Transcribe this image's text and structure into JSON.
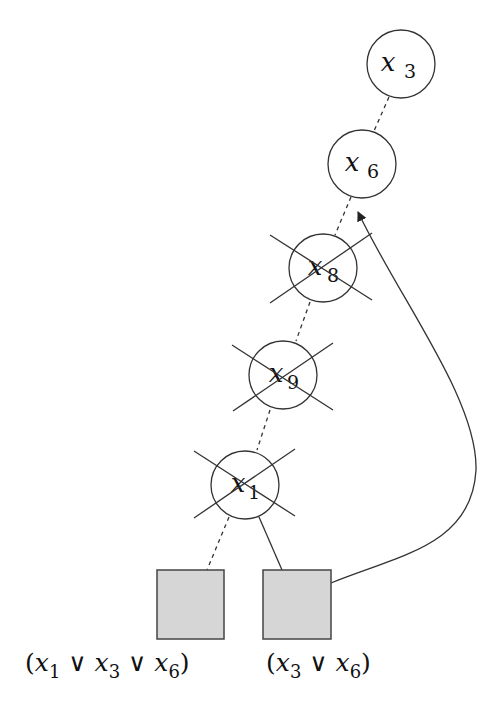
{
  "diagram": {
    "type": "implication-graph-backjump",
    "nodes": [
      {
        "id": "x3",
        "var": "x",
        "sub": "3",
        "crossed": false,
        "cx": 401,
        "cy": 64
      },
      {
        "id": "x6",
        "var": "x",
        "sub": "6",
        "crossed": false,
        "cx": 362,
        "cy": 164
      },
      {
        "id": "x8",
        "var": "x",
        "sub": "8",
        "crossed": true,
        "cx": 323,
        "cy": 268
      },
      {
        "id": "x9",
        "var": "x",
        "sub": "9",
        "crossed": true,
        "cx": 283,
        "cy": 375
      },
      {
        "id": "x1",
        "var": "x",
        "sub": "1",
        "crossed": true,
        "cx": 245,
        "cy": 485
      }
    ],
    "clauses": [
      {
        "id": "c1",
        "label_parts": [
          "(",
          "x",
          "1",
          " ∨ ",
          "x",
          "3",
          " ∨ ",
          "x",
          "6",
          ")"
        ],
        "text": "(x1 ∨ x3 ∨ x6)"
      },
      {
        "id": "c2",
        "label_parts": [
          "(",
          "x",
          "3",
          " ∨ ",
          "x",
          "6",
          ")"
        ],
        "text": "(x3 ∨ x6)"
      }
    ],
    "edges": [
      {
        "from": "x3",
        "to": "x6",
        "style": "dashed"
      },
      {
        "from": "x6",
        "to": "x8",
        "style": "dashed"
      },
      {
        "from": "x8",
        "to": "x9",
        "style": "dashed"
      },
      {
        "from": "x9",
        "to": "x1",
        "style": "dashed"
      },
      {
        "from": "x1",
        "to": "c1",
        "style": "dashed"
      },
      {
        "from": "x1",
        "to": "c2",
        "style": "solid"
      },
      {
        "from": "c2",
        "to": "x6",
        "style": "curved-arrow"
      }
    ],
    "colors": {
      "stroke": "#333333",
      "clause_fill": "#d6d6d6",
      "background": "#ffffff"
    }
  }
}
